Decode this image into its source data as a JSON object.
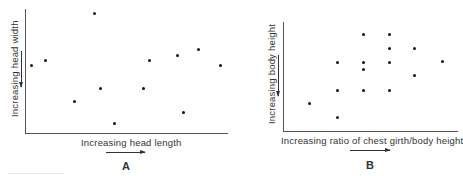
{
  "chart_data": [
    {
      "type": "scatter",
      "panel": "A",
      "title": "",
      "xlabel": "Increasing head length",
      "ylabel": "Increasing head width",
      "grid": false,
      "legend": null,
      "xlim": [
        0,
        100
      ],
      "ylim": [
        0,
        100
      ],
      "points": [
        {
          "x": 3,
          "y": 55
        },
        {
          "x": 10,
          "y": 59
        },
        {
          "x": 34,
          "y": 97
        },
        {
          "x": 24,
          "y": 26
        },
        {
          "x": 37,
          "y": 36
        },
        {
          "x": 44,
          "y": 8
        },
        {
          "x": 58,
          "y": 36
        },
        {
          "x": 61,
          "y": 59
        },
        {
          "x": 75,
          "y": 63
        },
        {
          "x": 78,
          "y": 17
        },
        {
          "x": 85,
          "y": 68
        },
        {
          "x": 96,
          "y": 55
        }
      ]
    },
    {
      "type": "scatter",
      "panel": "B",
      "title": "",
      "xlabel": "Increasing ratio of chest girth/body height",
      "ylabel": "Increasing body height",
      "grid": false,
      "legend": null,
      "xlim": [
        0,
        100
      ],
      "ylim": [
        0,
        100
      ],
      "points": [
        {
          "x": 15,
          "y": 26
        },
        {
          "x": 31,
          "y": 63
        },
        {
          "x": 31,
          "y": 38
        },
        {
          "x": 31,
          "y": 13
        },
        {
          "x": 46,
          "y": 89
        },
        {
          "x": 46,
          "y": 63
        },
        {
          "x": 46,
          "y": 57
        },
        {
          "x": 46,
          "y": 38
        },
        {
          "x": 61,
          "y": 89
        },
        {
          "x": 61,
          "y": 76
        },
        {
          "x": 61,
          "y": 63
        },
        {
          "x": 61,
          "y": 38
        },
        {
          "x": 76,
          "y": 76
        },
        {
          "x": 76,
          "y": 51
        },
        {
          "x": 92,
          "y": 64
        }
      ]
    }
  ],
  "panels": {
    "a": {
      "letter": "A",
      "xlabel": "Increasing head length",
      "ylabel": "Increasing head width"
    },
    "b": {
      "letter": "B",
      "xlabel": "Increasing ratio of chest girth/body height",
      "ylabel": "Increasing body height"
    }
  }
}
